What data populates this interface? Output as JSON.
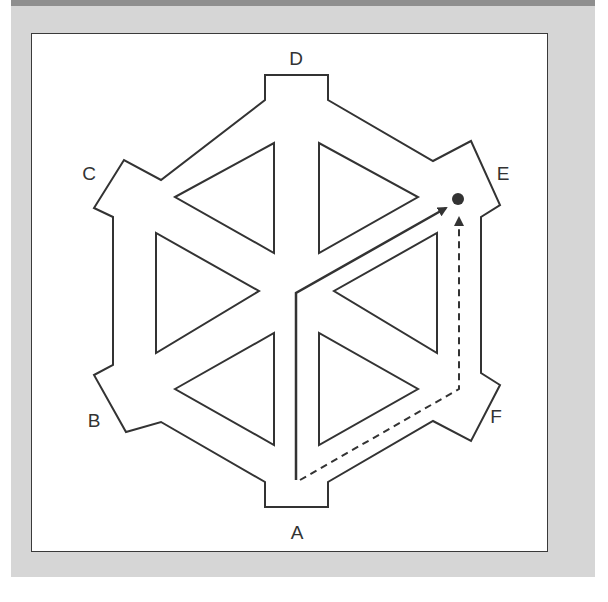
{
  "diagram": {
    "type": "hexagonal-maze",
    "labels": {
      "A": "A",
      "B": "B",
      "C": "C",
      "D": "D",
      "E": "E",
      "F": "F"
    },
    "paths": [
      {
        "name": "solid-path",
        "style": "solid",
        "from": "A",
        "to": "E-target",
        "via": "center"
      },
      {
        "name": "dashed-path",
        "style": "dashed",
        "from": "A",
        "to": "E-target",
        "via": "F-corridor"
      }
    ],
    "target": {
      "name": "target-dot",
      "near": "E"
    },
    "colors": {
      "panel_bg": "#d6d6d6",
      "panel_topbar": "#8f8f8f",
      "frame_bg": "#ffffff",
      "line": "#333333"
    }
  }
}
